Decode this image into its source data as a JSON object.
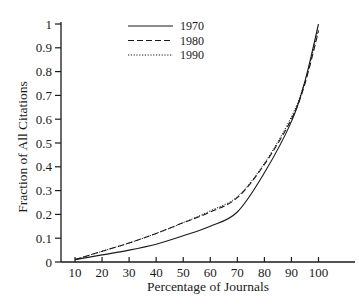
{
  "chart_data": {
    "type": "line",
    "title": "",
    "xlabel": "Percentage of Journals",
    "ylabel": "Fraction of All Citations",
    "xlim": [
      5,
      112
    ],
    "ylim": [
      0,
      1
    ],
    "xticks": [
      10,
      20,
      30,
      40,
      50,
      60,
      70,
      80,
      90,
      100
    ],
    "yticks": [
      0,
      0.1,
      0.2,
      0.3,
      0.4,
      0.5,
      0.6,
      0.7,
      0.8,
      0.9,
      1
    ],
    "ytick_labels": [
      "0",
      "0.1",
      "0.2",
      "0.3",
      "0.4",
      "0.5",
      "0.6",
      "0.7",
      "0.8",
      "0.9",
      "1"
    ],
    "grid": false,
    "legend_position": "upper-center",
    "x": [
      10,
      20,
      30,
      40,
      50,
      60,
      70,
      80,
      90,
      95,
      100
    ],
    "series": [
      {
        "name": "1970",
        "style": "solid",
        "values": [
          0.01,
          0.03,
          0.05,
          0.075,
          0.11,
          0.15,
          0.21,
          0.375,
          0.59,
          0.76,
          1.0
        ]
      },
      {
        "name": "1980",
        "style": "dashed",
        "values": [
          0.01,
          0.045,
          0.08,
          0.12,
          0.165,
          0.21,
          0.27,
          0.41,
          0.6,
          0.75,
          0.97
        ]
      },
      {
        "name": "1990",
        "style": "dotted",
        "values": [
          0.01,
          0.045,
          0.08,
          0.12,
          0.165,
          0.215,
          0.275,
          0.415,
          0.61,
          0.76,
          0.98
        ]
      }
    ]
  },
  "legend": {
    "items": [
      {
        "label": "1970",
        "style": "solid"
      },
      {
        "label": "1980",
        "style": "dashed"
      },
      {
        "label": "1990",
        "style": "dotted"
      }
    ]
  },
  "colors": {
    "line": "#1a1a1a",
    "axis": "#1a1a1a",
    "background": "#ffffff"
  }
}
